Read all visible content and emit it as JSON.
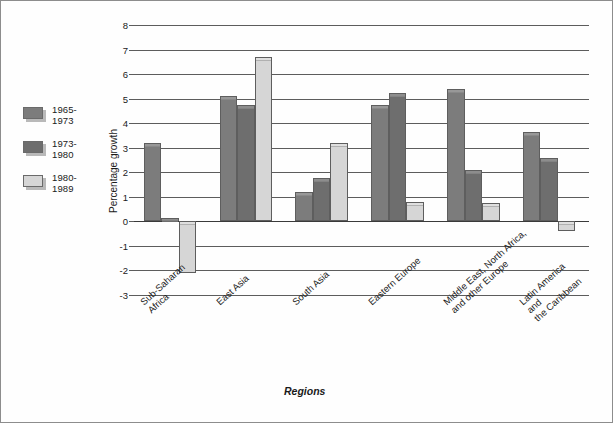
{
  "chart_data": {
    "type": "bar",
    "title": "",
    "xlabel": "Regions",
    "ylabel": "Percentage growth",
    "ylim": [
      -3,
      8
    ],
    "yticks": [
      8,
      7,
      6,
      5,
      4,
      3,
      2,
      1,
      0,
      -1,
      -2,
      -3
    ],
    "ytick_labels": [
      "8",
      "7",
      "6",
      "5",
      "4",
      "3",
      "2",
      "1",
      "0",
      "-1",
      "-2",
      "-3"
    ],
    "grid": true,
    "legend_position": "left-outside",
    "categories": [
      "Sub-Saharan\nAfrica",
      "East Asia",
      "South Asia",
      "Eastern Europe",
      "Middle East, North Africa,\nand other Europe",
      "Latin America and\nthe Caribbean"
    ],
    "series": [
      {
        "name": "1965-\n1973",
        "color": "#7c7c7c",
        "values": [
          3.2,
          5.1,
          1.2,
          4.75,
          5.4,
          3.65
        ]
      },
      {
        "name": "1973-\n1980",
        "color": "#6e6e6e",
        "values": [
          0.15,
          4.75,
          1.75,
          5.25,
          2.1,
          2.6
        ]
      },
      {
        "name": "1980-\n1989",
        "color": "#d6d6d6",
        "values": [
          -2.1,
          6.7,
          3.2,
          0.8,
          0.75,
          -0.4
        ]
      }
    ]
  },
  "colors": {
    "gridline": "#5c5c5c",
    "axis": "#3a3a3a",
    "frame": "#8d8d8d",
    "background": "#ffffff",
    "bar_border": "#5e5e5e"
  }
}
